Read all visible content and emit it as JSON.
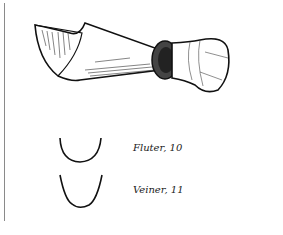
{
  "figure": {
    "profiles": [
      {
        "label": "Fluter, 10",
        "shape": "rounded-u"
      },
      {
        "label": "Veiner, 11",
        "shape": "deep-v-u"
      }
    ]
  },
  "colors": {
    "ink": "#111111",
    "paper": "#ffffff",
    "rule": "#8a8a8a"
  }
}
